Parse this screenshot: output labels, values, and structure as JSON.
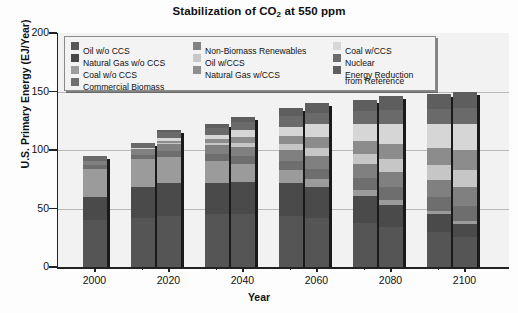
{
  "chart_data": {
    "type": "bar",
    "title": "Stabilization of CO2 at 550 ppm",
    "title_main": "Stabilization of CO",
    "title_sub": "2",
    "title_tail": " at 550 ppm",
    "xlabel": "Year",
    "ylabel": "U.S. Primary Energy (EJ/Year)",
    "ylim": [
      0,
      200
    ],
    "yticks": [
      0,
      50,
      100,
      150,
      200
    ],
    "grid": true,
    "legend_position": "top-left-inside",
    "xticks": [
      "2000",
      "2020",
      "2040",
      "2060",
      "2080",
      "2100"
    ],
    "categories": [
      "2000",
      "2010",
      "2020",
      "2030",
      "2040",
      "2050",
      "2060",
      "2070",
      "2080",
      "2090",
      "2100"
    ],
    "totals": [
      95,
      106,
      117,
      122,
      128,
      136,
      140,
      143,
      146,
      148,
      150
    ],
    "series": [
      {
        "name": "Oil w/o CCS",
        "color": "#555555",
        "values": [
          40,
          42,
          44,
          45,
          45,
          44,
          42,
          38,
          34,
          30,
          26
        ]
      },
      {
        "name": "Natural Gas w/o CCS",
        "color": "#4a4a4a",
        "values": [
          20,
          26,
          28,
          27,
          28,
          28,
          26,
          23,
          19,
          15,
          11
        ]
      },
      {
        "name": "Coal w/o CCS",
        "color": "#9b9b9b",
        "values": [
          24,
          24,
          22,
          19,
          15,
          11,
          7,
          5,
          4,
          3,
          2
        ]
      },
      {
        "name": "Commercial Biomass",
        "color": "#6e6e6e",
        "values": [
          3,
          4,
          5,
          6,
          7,
          8,
          9,
          10,
          11,
          12,
          13
        ]
      },
      {
        "name": "Non-Biomass Renewables",
        "color": "#808080",
        "values": [
          4,
          5,
          6,
          7,
          8,
          9,
          11,
          12,
          13,
          14,
          16
        ]
      },
      {
        "name": "Oil w/CCS",
        "color": "#c6c6c6",
        "values": [
          0,
          0,
          1,
          2,
          3,
          5,
          7,
          9,
          11,
          13,
          15
        ]
      },
      {
        "name": "Natural Gas w/CCS",
        "color": "#8c8c8c",
        "values": [
          0,
          0,
          2,
          3,
          5,
          7,
          9,
          11,
          13,
          15,
          17
        ]
      },
      {
        "name": "Coal w/CCS",
        "color": "#d6d6d6",
        "values": [
          0,
          1,
          2,
          4,
          6,
          8,
          11,
          14,
          17,
          20,
          22
        ]
      },
      {
        "name": "Nuclear",
        "color": "#6a6a6a",
        "values": [
          4,
          4,
          5,
          6,
          7,
          9,
          10,
          11,
          12,
          13,
          14
        ]
      },
      {
        "name": "Energy Reduction from Reference",
        "color": "#5e5e5e",
        "values": [
          0,
          0,
          2,
          3,
          4,
          7,
          8,
          10,
          12,
          13,
          14
        ]
      }
    ]
  },
  "legend": {
    "columns": [
      {
        "items": [
          {
            "label": "Oil w/o CCS",
            "color": "#575757"
          },
          {
            "label": "Natural Gas w/o CCS",
            "color": "#474747"
          },
          {
            "label": "Coal w/o CCS",
            "color": "#9d9d9d"
          },
          {
            "label": "Commercial Biomass",
            "color": "#707070"
          }
        ]
      },
      {
        "items": [
          {
            "label": "Non-Biomass Renewables",
            "color": "#828282"
          },
          {
            "label": "Oil w/CCS",
            "color": "#c8c8c8"
          },
          {
            "label": "Natural Gas w/CCS",
            "color": "#8e8e8e"
          }
        ]
      },
      {
        "items": [
          {
            "label": "Coal w/CCS",
            "color": "#d8d8d8"
          },
          {
            "label": "Nuclear",
            "color": "#6c6c6c"
          },
          {
            "label": "Energy Reduction",
            "label2": "from Reference",
            "color": "#5f5f5f"
          }
        ]
      }
    ]
  }
}
